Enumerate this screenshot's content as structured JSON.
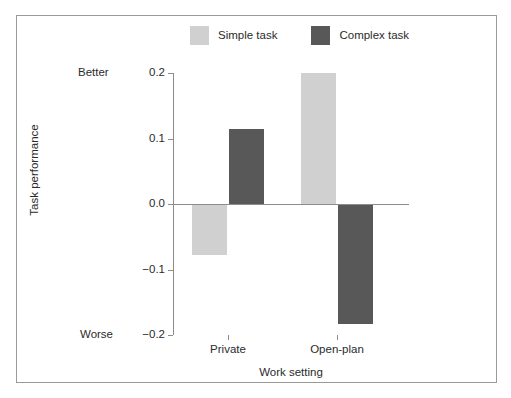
{
  "chart_data": {
    "type": "bar",
    "title": "",
    "subtitle": "",
    "xlabel": "Work setting",
    "ylabel": "Task performance",
    "categories": [
      "Private",
      "Open-plan"
    ],
    "series": [
      {
        "name": "Simple task",
        "color": "#d0d0d0",
        "values": [
          -0.078,
          0.2
        ]
      },
      {
        "name": "Complex task",
        "color": "#585858",
        "values": [
          0.115,
          -0.183
        ]
      }
    ],
    "ylim": [
      -0.2,
      0.2
    ],
    "yticks": [
      0.2,
      0.1,
      0.0,
      -0.1,
      -0.2
    ],
    "ytick_labels": [
      "0.2",
      "0.1",
      "0.0",
      "−0.1",
      "−0.2"
    ],
    "y_axis_endpoint_labels": {
      "top": "Better",
      "bottom": "Worse"
    },
    "grid": false,
    "legend_position": "top-center",
    "zero_line": true
  },
  "legend": {
    "entries": [
      {
        "label": "Simple task",
        "color": "#d0d0d0"
      },
      {
        "label": "Complex task",
        "color": "#585858"
      }
    ]
  },
  "axes": {
    "y": {
      "title": "Task performance",
      "ticks": [
        {
          "label": "0.2",
          "value": 0.2
        },
        {
          "label": "0.1",
          "value": 0.1
        },
        {
          "label": "0.0",
          "value": 0.0
        },
        {
          "label": "−0.1",
          "value": -0.1
        },
        {
          "label": "−0.2",
          "value": -0.2
        }
      ],
      "top_label": "Better",
      "bottom_label": "Worse"
    },
    "x": {
      "title": "Work setting",
      "categories": [
        "Private",
        "Open-plan"
      ]
    }
  },
  "colors": {
    "simple_task": "#d0d0d0",
    "complex_task": "#585858",
    "axis": "#8c8c8c",
    "frame": "#9a9a9a",
    "text": "#2b2b2b"
  }
}
